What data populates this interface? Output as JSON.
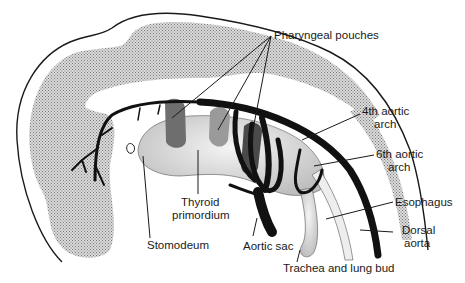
{
  "diagram": {
    "labels": {
      "pharyngeal_pouches": "Pharyngeal pouches",
      "fourth_arch_line1": "4th aortic",
      "fourth_arch_line2": "arch",
      "sixth_arch_line1": "6th aortic",
      "sixth_arch_line2": "arch",
      "esophagus": "Esophagus",
      "dorsal_aorta_line1": "Dorsal",
      "dorsal_aorta_line2": "aorta",
      "trachea": "Trachea and lung bud",
      "aortic_sac": "Aortic sac",
      "thyroid_line1": "Thyroid",
      "thyroid_line2": "primordium",
      "stomodeum": "Stomodeum"
    },
    "colors": {
      "stipple_fill": "#c8c8c8",
      "vessel": "#111111",
      "pouch_dark": "#6e6e6e",
      "pouch_mid": "#9a9a9a",
      "endoderm": "#e4e4e4"
    }
  }
}
